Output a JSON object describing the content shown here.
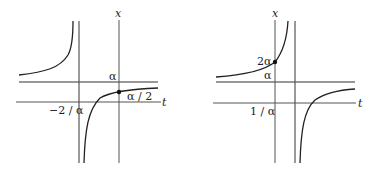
{
  "figures": [
    {
      "name": "left-graph",
      "axis_x_label": "x",
      "axis_t_label": "t",
      "asymptote_label": "α",
      "t_intercept_label": "−2 / α",
      "point_label": "α / 2"
    },
    {
      "name": "right-graph",
      "axis_x_label": "x",
      "axis_t_label": "t",
      "asymptote_label": "α",
      "t_intercept_label": "1 / α",
      "point_label": "2α"
    }
  ],
  "colors": {
    "axis": "#555555",
    "curve": "#222222",
    "background": "#ffffff"
  }
}
